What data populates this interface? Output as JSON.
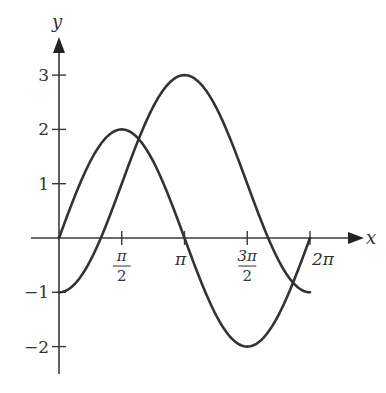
{
  "chart_data": {
    "type": "line",
    "title": "",
    "xlabel": "x",
    "ylabel": "y",
    "xlim": [
      0,
      6.2832
    ],
    "ylim": [
      -2,
      3
    ],
    "grid": false,
    "legend": "none",
    "x_ticks": [
      {
        "value": 1.5708,
        "label_num": "π",
        "label_den": "2"
      },
      {
        "value": 3.1416,
        "label": "π"
      },
      {
        "value": 4.7124,
        "label_num": "3π",
        "label_den": "2"
      },
      {
        "value": 6.2832,
        "label": "2π"
      }
    ],
    "y_ticks": [
      {
        "value": 3,
        "label": "3"
      },
      {
        "value": 2,
        "label": "2"
      },
      {
        "value": 1,
        "label": "1"
      },
      {
        "value": -1,
        "label": "−1"
      },
      {
        "value": -2,
        "label": "−2"
      }
    ],
    "series": [
      {
        "name": "y = 2 sin x",
        "x": [
          0,
          0.7854,
          1.5708,
          2.3562,
          3.1416,
          3.927,
          4.7124,
          5.4978,
          6.2832
        ],
        "values": [
          0,
          1.414,
          2,
          1.414,
          0,
          -1.414,
          -2,
          -1.414,
          0
        ]
      },
      {
        "name": "y = 1 − 2 cos x",
        "x": [
          0,
          0.7854,
          1.5708,
          2.3562,
          3.1416,
          3.927,
          4.7124,
          5.4978,
          6.2832
        ],
        "values": [
          -1,
          -0.414,
          1,
          2.414,
          3,
          2.414,
          1,
          -0.414,
          -1
        ]
      }
    ]
  },
  "axes": {
    "x_label": "x",
    "y_label": "y"
  },
  "colors": {
    "curve": "#333333",
    "axis": "#3a3a3a",
    "background": "#ffffff"
  }
}
